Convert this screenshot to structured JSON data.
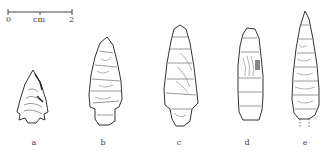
{
  "figure": {
    "type": "archaeological lithic illustration",
    "scale_bar": {
      "start_label": "0",
      "unit_label": "cm",
      "end_label": "2"
    },
    "artifacts": [
      {
        "label": "a",
        "description": "small triangular stemmed projectile point"
      },
      {
        "label": "b",
        "description": "stemmed projectile point"
      },
      {
        "label": "c",
        "description": "stemmed projectile point, elongated"
      },
      {
        "label": "d",
        "description": "narrow parallel-sided point"
      },
      {
        "label": "e",
        "description": "long lanceolate point, dashed base"
      }
    ]
  },
  "colors": {
    "line": "#3a3a3a",
    "background": "#ffffff"
  }
}
